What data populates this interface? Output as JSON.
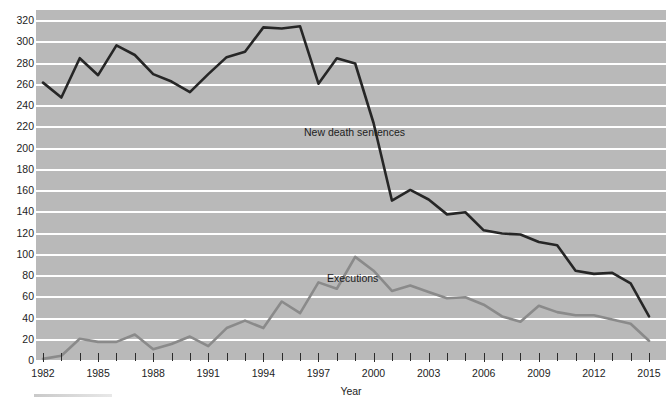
{
  "chart_data": {
    "type": "line",
    "title": "",
    "xlabel": "Year",
    "ylabel": "",
    "xlim": [
      1982,
      2015
    ],
    "ylim": [
      0,
      320
    ],
    "grid": true,
    "legend_position": "inline-annotation",
    "y_ticks": [
      0,
      20,
      40,
      60,
      80,
      100,
      120,
      140,
      160,
      180,
      200,
      220,
      240,
      260,
      280,
      300,
      320
    ],
    "x_ticks": [
      1982,
      1983,
      1984,
      1985,
      1986,
      1987,
      1988,
      1989,
      1990,
      1991,
      1992,
      1993,
      1994,
      1995,
      1996,
      1997,
      1998,
      1999,
      2000,
      2001,
      2002,
      2003,
      2004,
      2005,
      2006,
      2007,
      2008,
      2009,
      2010,
      2011,
      2012,
      2013,
      2014,
      2015
    ],
    "x_tick_labels": [
      "1982",
      "1985",
      "1988",
      "1991",
      "1994",
      "1997",
      "2000",
      "2003",
      "2006",
      "2009",
      "2012",
      "2015"
    ],
    "x_tick_label_years": [
      1982,
      1985,
      1988,
      1991,
      1994,
      1997,
      2000,
      2003,
      2006,
      2009,
      2012,
      2015
    ],
    "x": [
      1982,
      1983,
      1984,
      1985,
      1986,
      1987,
      1988,
      1989,
      1990,
      1991,
      1992,
      1993,
      1994,
      1995,
      1996,
      1997,
      1998,
      1999,
      2000,
      2001,
      2002,
      2003,
      2004,
      2005,
      2006,
      2007,
      2008,
      2009,
      2010,
      2011,
      2012,
      2013,
      2014,
      2015
    ],
    "series": [
      {
        "name": "New death sentences",
        "color": "#262626",
        "values": [
          262,
          248,
          285,
          269,
          297,
          288,
          270,
          263,
          253,
          270,
          286,
          291,
          314,
          313,
          315,
          261,
          285,
          280,
          224,
          151,
          161,
          152,
          138,
          140,
          123,
          120,
          119,
          112,
          109,
          85,
          82,
          83,
          73,
          42
        ]
      },
      {
        "name": "Executions",
        "color": "#8a8a8a",
        "values": [
          2,
          5,
          21,
          18,
          18,
          25,
          11,
          16,
          23,
          14,
          31,
          38,
          31,
          56,
          45,
          74,
          68,
          98,
          85,
          66,
          71,
          65,
          59,
          60,
          53,
          42,
          37,
          52,
          46,
          43,
          43,
          39,
          35,
          19
        ]
      }
    ],
    "annotations": [
      {
        "text": "New death sentences",
        "series": "New death sentences"
      },
      {
        "text": "Executions",
        "series": "Executions"
      }
    ]
  },
  "axis": {
    "x_title": "Year"
  },
  "style": {
    "panel_background": "#b9b9b9",
    "gridline_color": "#ffffff",
    "page_background": "#ffffff",
    "text_color": "#1d1d1d"
  }
}
